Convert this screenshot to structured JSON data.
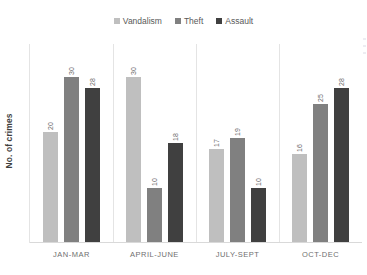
{
  "chart_data": {
    "type": "bar",
    "title": "",
    "xlabel": "",
    "ylabel": "No. of crimes",
    "categories": [
      "JAN-MAR",
      "APRIL-JUNE",
      "JULY-SEPT",
      "OCT-DEC"
    ],
    "series": [
      {
        "name": "Vandalism",
        "color": "#bfbfbf",
        "values": [
          20,
          30,
          17,
          16
        ]
      },
      {
        "name": "Theft",
        "color": "#808080",
        "values": [
          30,
          10,
          19,
          25
        ]
      },
      {
        "name": "Assault",
        "color": "#404040",
        "values": [
          28,
          18,
          10,
          28
        ]
      }
    ],
    "ylim": [
      0,
      33
    ],
    "grid": false,
    "category_separators": true,
    "data_labels": true,
    "data_label_rotation": -90,
    "legend_position": "top-center"
  },
  "legend": {
    "items": [
      {
        "label": "Vandalism",
        "color": "#bfbfbf"
      },
      {
        "label": "Theft",
        "color": "#808080"
      },
      {
        "label": "Assault",
        "color": "#404040"
      }
    ]
  },
  "axis": {
    "y_title": "No. of crimes"
  },
  "groups": [
    {
      "category": "JAN-MAR",
      "bars": [
        {
          "series": "Vandalism",
          "value": 20,
          "label": "20",
          "color": "#bfbfbf"
        },
        {
          "series": "Theft",
          "value": 30,
          "label": "30",
          "color": "#808080"
        },
        {
          "series": "Assault",
          "value": 28,
          "label": "28",
          "color": "#404040"
        }
      ]
    },
    {
      "category": "APRIL-JUNE",
      "bars": [
        {
          "series": "Vandalism",
          "value": 30,
          "label": "30",
          "color": "#bfbfbf"
        },
        {
          "series": "Theft",
          "value": 10,
          "label": "10",
          "color": "#808080"
        },
        {
          "series": "Assault",
          "value": 18,
          "label": "18",
          "color": "#404040"
        }
      ]
    },
    {
      "category": "JULY-SEPT",
      "bars": [
        {
          "series": "Vandalism",
          "value": 17,
          "label": "17",
          "color": "#bfbfbf"
        },
        {
          "series": "Theft",
          "value": 19,
          "label": "19",
          "color": "#808080"
        },
        {
          "series": "Assault",
          "value": 10,
          "label": "10",
          "color": "#404040"
        }
      ]
    },
    {
      "category": "OCT-DEC",
      "bars": [
        {
          "series": "Vandalism",
          "value": 16,
          "label": "16",
          "color": "#bfbfbf"
        },
        {
          "series": "Theft",
          "value": 25,
          "label": "25",
          "color": "#808080"
        },
        {
          "series": "Assault",
          "value": 28,
          "label": "28",
          "color": "#404040"
        }
      ]
    }
  ]
}
